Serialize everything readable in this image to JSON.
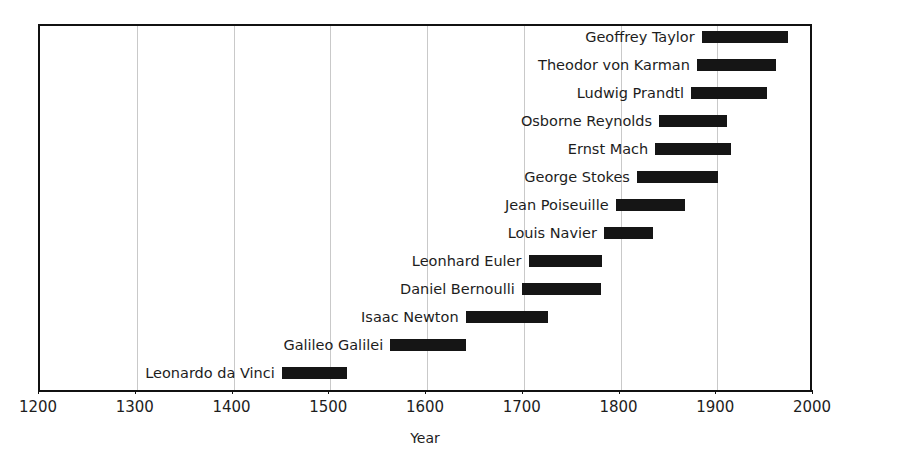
{
  "chart_data": {
    "type": "bar",
    "orientation": "horizontal",
    "subtype": "timeline-gantt",
    "title": "",
    "xlabel": "Year",
    "ylabel": "",
    "xlim": [
      1200,
      2000
    ],
    "xticks": [
      1200,
      1300,
      1400,
      1500,
      1600,
      1700,
      1800,
      1900,
      2000
    ],
    "xtick_labels": [
      "1200",
      "1300",
      "1400",
      "1500",
      "1600",
      "1700",
      "1800",
      "1900",
      "2000"
    ],
    "grid": true,
    "grid_axis": "x",
    "legend": false,
    "bar_color": "#151515",
    "categories": [
      "Geoffrey Taylor",
      "Theodor von Karman",
      "Ludwig Prandtl",
      "Osborne Reynolds",
      "Ernst Mach",
      "George Stokes",
      "Jean Poiseuille",
      "Louis Navier",
      "Leonhard Euler",
      "Daniel Bernoulli",
      "Isaac Newton",
      "Galileo Galilei",
      "Leonardo da Vinci"
    ],
    "bars": [
      {
        "label": "Geoffrey Taylor",
        "start": 1886,
        "end": 1975
      },
      {
        "label": "Theodor von Karman",
        "start": 1881,
        "end": 1963
      },
      {
        "label": "Ludwig Prandtl",
        "start": 1875,
        "end": 1953
      },
      {
        "label": "Osborne Reynolds",
        "start": 1842,
        "end": 1912
      },
      {
        "label": "Ernst Mach",
        "start": 1838,
        "end": 1916
      },
      {
        "label": "George Stokes",
        "start": 1819,
        "end": 1903
      },
      {
        "label": "Jean Poiseuille",
        "start": 1797,
        "end": 1869
      },
      {
        "label": "Louis Navier",
        "start": 1785,
        "end": 1836
      },
      {
        "label": "Leonhard Euler",
        "start": 1707,
        "end": 1783
      },
      {
        "label": "Daniel Bernoulli",
        "start": 1700,
        "end": 1782
      },
      {
        "label": "Isaac Newton",
        "start": 1642,
        "end": 1727
      },
      {
        "label": "Galileo Galilei",
        "start": 1564,
        "end": 1642
      },
      {
        "label": "Leonardo da Vinci",
        "start": 1452,
        "end": 1519
      }
    ]
  },
  "axis": {
    "title": "Year"
  }
}
